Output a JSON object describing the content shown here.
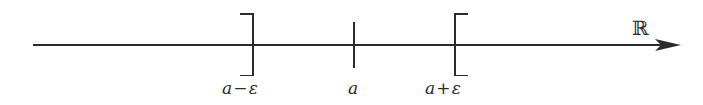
{
  "figure": {
    "background_color": "#ffffff",
    "stroke_color": "#2b2b2b",
    "width": 703,
    "height": 105
  },
  "axis": {
    "name": "real-number-line",
    "label": "ℝ",
    "label_x": 632,
    "label_y": 18,
    "line_y": 45,
    "x_start": 33,
    "x_end": 662,
    "arrow_tip_x": 681,
    "arrow_head_half_height": 6,
    "thin_stroke_width": 1.4,
    "thick_stroke_width": 2.2
  },
  "interval": {
    "name": "epsilon-interval",
    "left_x": 253,
    "right_x": 455,
    "center_x": 354,
    "highlight": true
  },
  "marks": [
    {
      "name": "left-bracket",
      "kind": "bracket",
      "orientation": "closing",
      "x": 253,
      "y_top": 13,
      "y_bottom": 76,
      "tick_length": 13,
      "label": "a−ε",
      "label_base": "a",
      "label_op": "−",
      "label_eps": "ε",
      "label_x": 222,
      "label_y": 80
    },
    {
      "name": "center-tick",
      "kind": "tick",
      "orientation": "none",
      "x": 354,
      "y_top": 22,
      "y_bottom": 68,
      "tick_length": 0,
      "label": "a",
      "label_base": "a",
      "label_op": "",
      "label_eps": "",
      "label_x": 348,
      "label_y": 80
    },
    {
      "name": "right-bracket",
      "kind": "bracket",
      "orientation": "opening",
      "x": 455,
      "y_top": 13,
      "y_bottom": 76,
      "tick_length": 13,
      "label": "a+ε",
      "label_base": "a",
      "label_op": "+",
      "label_eps": "ε",
      "label_x": 425,
      "label_y": 80
    }
  ]
}
